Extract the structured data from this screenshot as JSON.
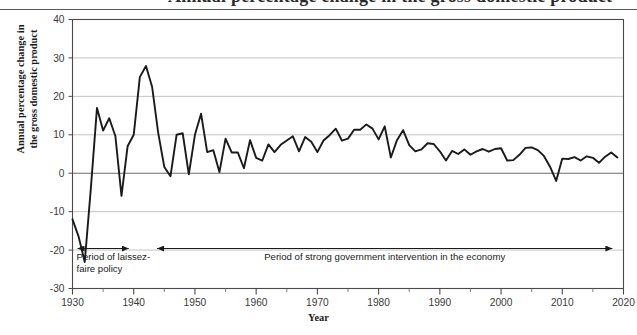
{
  "figure": {
    "cut_title": "Annual percentage change in the gross domestic product",
    "y_axis_title_line1": "Annual percentage change in",
    "y_axis_title_line2": "the gross domestic product",
    "x_axis_title": "Year"
  },
  "annotations": [
    {
      "id": "laissez-faire",
      "line1": "Period of laissez-",
      "line2": "faire policy",
      "start_year": 1930,
      "end_year": 1940,
      "arrow": "double"
    },
    {
      "id": "gov-intervention",
      "line1": "Period of strong government intervention in the economy",
      "line2": "",
      "start_year": 1943,
      "end_year": 2019,
      "arrow": "double"
    }
  ],
  "chart_data": {
    "type": "line",
    "title": "Annual percentage change in the gross domestic product",
    "xlabel": "Year",
    "ylabel": "Annual percentage change in the gross domestic product",
    "xlim": [
      1930,
      2020
    ],
    "ylim": [
      -30,
      40
    ],
    "xticks": [
      1930,
      1940,
      1950,
      1960,
      1970,
      1980,
      1990,
      2000,
      2010,
      2020
    ],
    "xtick_labels": [
      "1930",
      "1940",
      "1950",
      "1960",
      "1970",
      "1980",
      "1990",
      "2000",
      "2010",
      "2020"
    ],
    "xminor_interval": 5,
    "yticks": [
      -30,
      -20,
      -10,
      0,
      10,
      20,
      30,
      40
    ],
    "ytick_labels": [
      "-30",
      "-20",
      "-10",
      "0",
      "10",
      "20",
      "30",
      "40"
    ],
    "grid": "horizontal",
    "legend": "none",
    "line_color": "#1a1a1a",
    "line_width": 1.9,
    "series": [
      {
        "name": "Annual percentage change in GDP",
        "x": [
          1930,
          1931,
          1932,
          1933,
          1934,
          1935,
          1936,
          1937,
          1938,
          1939,
          1940,
          1941,
          1942,
          1943,
          1944,
          1945,
          1946,
          1947,
          1948,
          1949,
          1950,
          1951,
          1952,
          1953,
          1954,
          1955,
          1956,
          1957,
          1958,
          1959,
          1960,
          1961,
          1962,
          1963,
          1964,
          1965,
          1966,
          1967,
          1968,
          1969,
          1970,
          1971,
          1972,
          1973,
          1974,
          1975,
          1976,
          1977,
          1978,
          1979,
          1980,
          1981,
          1982,
          1983,
          1984,
          1985,
          1986,
          1987,
          1988,
          1989,
          1990,
          1991,
          1992,
          1993,
          1994,
          1995,
          1996,
          1997,
          1998,
          1999,
          2000,
          2001,
          2002,
          2003,
          2004,
          2005,
          2006,
          2007,
          2008,
          2009,
          2010,
          2011,
          2012,
          2013,
          2014,
          2015,
          2016,
          2017,
          2018,
          2019
        ],
        "y": [
          -12.0,
          -16.5,
          -23.1,
          -3.9,
          17.0,
          11.1,
          14.3,
          9.7,
          -5.9,
          7.0,
          10.0,
          25.0,
          27.9,
          22.5,
          10.5,
          1.6,
          -0.8,
          10.0,
          10.4,
          -0.3,
          10.0,
          15.5,
          5.5,
          6.0,
          0.3,
          9.0,
          5.4,
          5.4,
          1.3,
          8.6,
          4.0,
          3.3,
          7.5,
          5.5,
          7.4,
          8.5,
          9.6,
          5.7,
          9.4,
          8.2,
          5.5,
          8.5,
          9.9,
          11.6,
          8.5,
          9.0,
          11.3,
          11.3,
          12.7,
          11.6,
          8.8,
          12.2,
          4.1,
          8.6,
          11.2,
          7.3,
          5.7,
          6.2,
          7.8,
          7.6,
          5.7,
          3.3,
          5.8,
          5.0,
          6.2,
          4.8,
          5.7,
          6.3,
          5.6,
          6.3,
          6.5,
          3.3,
          3.4,
          4.8,
          6.6,
          6.7,
          6.0,
          4.5,
          1.7,
          -2.0,
          3.8,
          3.7,
          4.2,
          3.3,
          4.4,
          4.0,
          2.7,
          4.3,
          5.4,
          4.1
        ]
      }
    ]
  }
}
